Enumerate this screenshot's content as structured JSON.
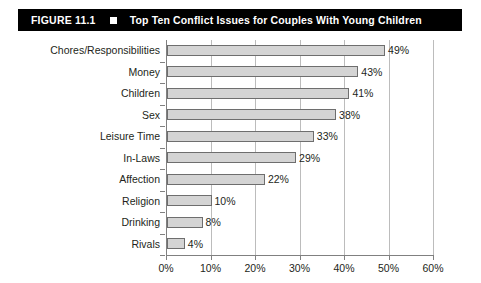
{
  "figure": {
    "number": "FIGURE 11.1",
    "bullet_icon": "square-bullet-icon",
    "title": "Top Ten Conflict Issues for Couples With Young Children"
  },
  "colors": {
    "header_background": "#000000",
    "header_text": "#ffffff",
    "bar_fill": "#d4d4d4",
    "bar_border": "#6e6e6e",
    "gridline": "#bcbcbc",
    "axis": "#808080",
    "text": "#231f20"
  },
  "chart_data": {
    "type": "bar",
    "orientation": "horizontal",
    "title": "Top Ten Conflict Issues for Couples With Young Children",
    "xlabel": "",
    "ylabel": "",
    "categories": [
      "Chores/Responsibilities",
      "Money",
      "Children",
      "Sex",
      "Leisure Time",
      "In-Laws",
      "Affection",
      "Religion",
      "Drinking",
      "Rivals"
    ],
    "values": [
      49,
      43,
      41,
      38,
      33,
      29,
      22,
      10,
      8,
      4
    ],
    "value_labels": [
      "49%",
      "43%",
      "41%",
      "38%",
      "33%",
      "29%",
      "22%",
      "10%",
      "8%",
      "4%"
    ],
    "xlim": [
      0,
      60
    ],
    "xticks": [
      0,
      10,
      20,
      30,
      40,
      50,
      60
    ],
    "xtick_labels": [
      "0%",
      "10%",
      "20%",
      "30%",
      "40%",
      "50%",
      "60%"
    ],
    "grid": "vertical",
    "legend": "none"
  }
}
